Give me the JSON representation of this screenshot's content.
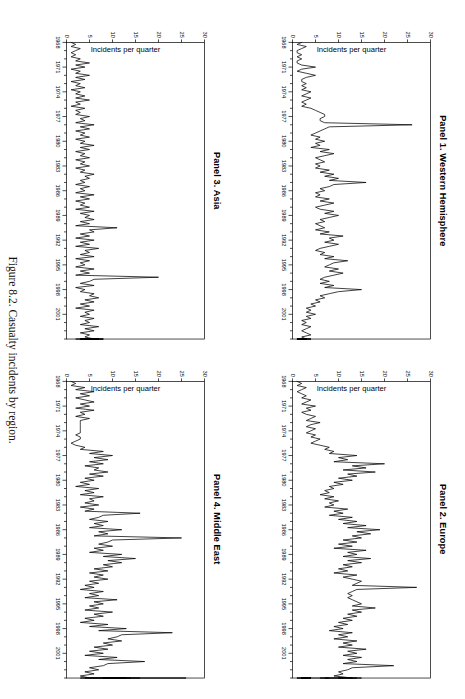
{
  "figure": {
    "caption": "Figure 8.2.  Casualty incidents by region.",
    "caption_number": "Figure 8.2.",
    "caption_text": "Casualty incidents by region."
  },
  "axes": {
    "ylabel": "Incidents per quarter",
    "yticks": [
      "0",
      "5",
      "10",
      "15",
      "20",
      "25",
      "30"
    ],
    "ytick_values": [
      0,
      5,
      10,
      15,
      20,
      25,
      30
    ],
    "ylim": [
      0,
      30
    ],
    "xticks": [
      "1968",
      "1971",
      "1974",
      "1977",
      "1980",
      "1983",
      "1986",
      "1989",
      "1992",
      "1995",
      "1998",
      "2001"
    ],
    "xtick_values": [
      1968,
      1971,
      1974,
      1977,
      1980,
      1983,
      1986,
      1989,
      1992,
      1995,
      1998,
      2001
    ],
    "xlim": [
      1968,
      2004
    ],
    "xlabel": "",
    "grid": false,
    "legend": "none"
  },
  "panels": [
    {
      "id": "panel-1",
      "title": "Panel 1. Western Hemisphere"
    },
    {
      "id": "panel-2",
      "title": "Panel 2. Europe"
    },
    {
      "id": "panel-3",
      "title": "Panel 3. Asia"
    },
    {
      "id": "panel-4",
      "title": "Panel 4. Middle East"
    }
  ],
  "chart_data": [
    {
      "type": "line",
      "title": "Panel 1. Western Hemisphere",
      "xlabel": "",
      "ylabel": "Incidents per quarter",
      "xlim": [
        1968,
        2004
      ],
      "ylim": [
        0,
        30
      ],
      "x_start_year": 1968,
      "x_step_years": 0.25,
      "series": [
        {
          "name": "Western Hemisphere casualty incidents",
          "values": [
            2,
            1,
            3,
            2,
            1,
            1,
            2,
            1,
            2,
            1,
            1,
            2,
            5,
            2,
            1,
            3,
            5,
            3,
            2,
            2,
            3,
            2,
            3,
            2,
            4,
            3,
            2,
            4,
            3,
            2,
            3,
            2,
            4,
            5,
            6,
            7,
            7,
            6,
            6,
            7,
            26,
            8,
            7,
            6,
            5,
            4,
            6,
            5,
            7,
            5,
            6,
            4,
            8,
            6,
            9,
            7,
            5,
            6,
            7,
            5,
            6,
            5,
            8,
            6,
            9,
            7,
            10,
            8,
            16,
            9,
            8,
            6,
            7,
            5,
            6,
            5,
            8,
            6,
            9,
            7,
            5,
            6,
            9,
            7,
            10,
            8,
            6,
            7,
            5,
            6,
            7,
            5,
            8,
            6,
            11,
            8,
            9,
            7,
            10,
            8,
            6,
            5,
            7,
            6,
            9,
            7,
            12,
            9,
            8,
            7,
            10,
            8,
            11,
            9,
            7,
            6,
            8,
            6,
            9,
            7,
            15,
            10,
            8,
            6,
            7,
            5,
            6,
            4,
            5,
            3,
            4,
            3,
            5,
            3,
            4,
            2,
            3,
            2,
            4,
            3,
            2,
            3,
            4,
            2,
            3,
            2,
            3,
            4,
            2,
            3,
            2,
            1,
            2,
            3,
            2,
            1,
            2,
            3,
            2,
            1,
            3,
            2,
            1,
            2,
            3,
            2,
            4,
            3,
            2,
            3,
            2,
            1,
            2,
            3,
            2,
            1,
            2,
            3,
            2,
            1
          ]
        }
      ]
    },
    {
      "type": "line",
      "title": "Panel 2. Europe",
      "xlabel": "",
      "ylabel": "Incidents per quarter",
      "xlim": [
        1968,
        2004
      ],
      "ylim": [
        0,
        30
      ],
      "x_start_year": 1968,
      "x_step_years": 0.25,
      "series": [
        {
          "name": "Europe casualty incidents",
          "values": [
            1,
            2,
            1,
            3,
            2,
            1,
            2,
            3,
            2,
            4,
            3,
            2,
            5,
            3,
            4,
            2,
            3,
            5,
            4,
            3,
            6,
            4,
            3,
            5,
            4,
            3,
            5,
            4,
            6,
            5,
            4,
            6,
            8,
            7,
            9,
            8,
            14,
            10,
            12,
            9,
            20,
            13,
            16,
            11,
            18,
            12,
            14,
            10,
            13,
            9,
            11,
            8,
            9,
            7,
            8,
            6,
            9,
            7,
            10,
            8,
            9,
            7,
            12,
            9,
            11,
            8,
            13,
            10,
            14,
            11,
            16,
            12,
            19,
            14,
            17,
            13,
            15,
            11,
            14,
            10,
            13,
            9,
            16,
            12,
            14,
            11,
            17,
            12,
            15,
            11,
            13,
            10,
            12,
            9,
            14,
            11,
            13,
            15,
            14,
            13,
            27,
            14,
            13,
            12,
            13,
            12,
            13,
            14,
            15,
            13,
            18,
            13,
            15,
            12,
            14,
            11,
            13,
            10,
            12,
            9,
            11,
            8,
            13,
            10,
            12,
            9,
            14,
            11,
            13,
            10,
            16,
            12,
            14,
            11,
            15,
            12,
            14,
            11,
            22,
            13,
            12,
            10,
            11,
            9,
            13,
            10,
            15,
            12,
            14,
            10,
            12,
            9,
            11,
            8,
            9,
            8,
            8,
            7,
            8,
            7,
            8,
            6,
            7,
            5,
            4,
            2,
            3,
            2,
            4,
            3,
            3,
            2,
            4,
            3,
            2,
            3,
            4,
            2,
            3,
            2,
            3,
            4,
            2,
            3,
            2,
            1,
            3,
            2,
            3,
            1
          ]
        }
      ]
    },
    {
      "type": "line",
      "title": "Panel 3. Asia",
      "xlabel": "",
      "ylabel": "Incidents per quarter",
      "xlim": [
        1968,
        2004
      ],
      "ylim": [
        0,
        30
      ],
      "x_start_year": 1968,
      "x_step_years": 0.25,
      "series": [
        {
          "name": "Asia casualty incidents",
          "values": [
            1,
            2,
            1,
            3,
            2,
            1,
            2,
            1,
            3,
            2,
            5,
            2,
            4,
            1,
            3,
            2,
            5,
            2,
            4,
            1,
            3,
            2,
            4,
            1,
            3,
            2,
            4,
            2,
            5,
            2,
            3,
            1,
            4,
            2,
            3,
            2,
            5,
            3,
            4,
            2,
            6,
            3,
            5,
            2,
            4,
            3,
            5,
            2,
            4,
            3,
            6,
            3,
            5,
            2,
            4,
            3,
            5,
            2,
            4,
            3,
            5,
            2,
            4,
            3,
            6,
            4,
            5,
            3,
            4,
            2,
            5,
            3,
            4,
            2,
            6,
            3,
            5,
            2,
            4,
            3,
            5,
            2,
            6,
            3,
            5,
            4,
            6,
            3,
            5,
            2,
            11,
            5,
            6,
            3,
            5,
            2,
            6,
            3,
            5,
            2,
            7,
            4,
            5,
            3,
            6,
            2,
            5,
            3,
            4,
            2,
            6,
            3,
            5,
            2,
            20,
            6,
            5,
            3,
            6,
            2,
            4,
            3,
            6,
            5,
            7,
            4,
            6,
            3,
            5,
            2,
            6,
            4,
            5,
            3,
            6,
            4,
            5,
            3,
            7,
            4,
            6,
            3,
            5,
            4,
            6,
            3,
            5,
            2,
            6,
            4,
            5,
            3,
            7,
            4,
            6,
            3,
            5,
            4,
            6,
            3,
            7,
            5,
            6,
            4,
            8,
            5,
            6,
            4,
            7,
            5,
            6,
            4,
            7,
            5,
            8,
            5,
            7,
            5,
            6,
            4
          ]
        }
      ]
    },
    {
      "type": "line",
      "title": "Panel 4. Middle East",
      "xlabel": "",
      "ylabel": "Incidents per quarter",
      "xlim": [
        1968,
        2004
      ],
      "ylim": [
        0,
        30
      ],
      "x_start_year": 1968,
      "x_step_years": 0.25,
      "series": [
        {
          "name": "Middle East casualty incidents",
          "values": [
            1,
            2,
            1,
            4,
            2,
            6,
            3,
            5,
            2,
            4,
            6,
            3,
            5,
            2,
            6,
            3,
            4,
            2,
            5,
            3,
            3,
            3,
            3,
            3,
            3,
            3,
            2,
            3,
            3,
            2,
            1,
            2,
            4,
            3,
            8,
            5,
            10,
            6,
            9,
            5,
            8,
            4,
            7,
            6,
            9,
            5,
            8,
            4,
            6,
            3,
            5,
            2,
            7,
            4,
            6,
            3,
            8,
            5,
            6,
            4,
            7,
            3,
            6,
            4,
            16,
            8,
            7,
            5,
            9,
            6,
            8,
            5,
            12,
            7,
            9,
            6,
            25,
            10,
            9,
            7,
            10,
            6,
            8,
            5,
            12,
            8,
            15,
            9,
            12,
            8,
            10,
            6,
            9,
            5,
            8,
            6,
            9,
            5,
            7,
            4,
            6,
            3,
            8,
            5,
            7,
            4,
            11,
            6,
            8,
            5,
            7,
            4,
            10,
            6,
            8,
            4,
            6,
            3,
            9,
            5,
            13,
            7,
            23,
            12,
            11,
            9,
            12,
            8,
            10,
            6,
            9,
            5,
            8,
            4,
            11,
            7,
            17,
            9,
            8,
            5,
            7,
            4,
            6,
            3,
            5,
            3,
            6,
            4,
            7,
            5,
            9,
            6,
            11,
            7,
            13,
            9,
            12,
            8,
            14,
            9,
            11,
            8,
            12,
            9,
            11,
            8,
            16,
            10,
            26,
            11,
            13,
            9,
            11,
            8
          ]
        }
      ]
    }
  ]
}
